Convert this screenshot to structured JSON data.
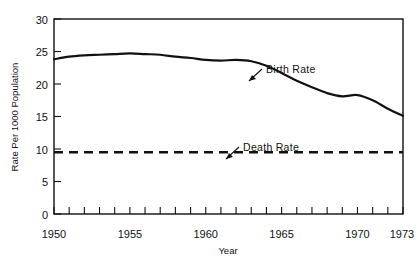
{
  "chart_data": {
    "type": "line",
    "title": "",
    "xlabel": "Year",
    "ylabel": "Rate Per 1000 Population",
    "xlim": [
      1950,
      1973
    ],
    "ylim": [
      0,
      30
    ],
    "grid": false,
    "legend_position": "inline-annotations",
    "x_tick_labels": [
      "1950",
      "1955",
      "1960",
      "1965",
      "1970",
      "1973"
    ],
    "x_tick_values": [
      1950,
      1955,
      1960,
      1965,
      1970,
      1973
    ],
    "x_minor_tick_interval": 1,
    "y_tick_labels": [
      "0",
      "5",
      "10",
      "15",
      "20",
      "25",
      "30"
    ],
    "y_tick_values": [
      0,
      5,
      10,
      15,
      20,
      25,
      30
    ],
    "x": [
      1950,
      1951,
      1952,
      1953,
      1954,
      1955,
      1956,
      1957,
      1958,
      1959,
      1960,
      1961,
      1962,
      1963,
      1964,
      1965,
      1966,
      1967,
      1968,
      1969,
      1970,
      1971,
      1972,
      1973
    ],
    "series": [
      {
        "name": "Birth Rate",
        "style": "solid",
        "color": "#111111",
        "values": [
          23.8,
          24.2,
          24.4,
          24.5,
          24.6,
          24.7,
          24.6,
          24.5,
          24.2,
          24.0,
          23.7,
          23.6,
          23.7,
          23.5,
          22.8,
          21.7,
          20.5,
          19.5,
          18.6,
          18.1,
          18.3,
          17.5,
          16.2,
          15.1
        ]
      },
      {
        "name": "Death Rate",
        "style": "dashed",
        "color": "#111111",
        "values": [
          9.5,
          9.5,
          9.5,
          9.5,
          9.5,
          9.5,
          9.5,
          9.5,
          9.5,
          9.5,
          9.5,
          9.5,
          9.5,
          9.5,
          9.5,
          9.5,
          9.5,
          9.5,
          9.5,
          9.5,
          9.5,
          9.5,
          9.5,
          9.5
        ]
      }
    ],
    "annotations": [
      {
        "text": "Birth Rate",
        "label_x": 266,
        "label_y": 73,
        "arrow_from_x": 262,
        "arrow_from_y": 70,
        "arrow_to_x": 248,
        "arrow_to_y": 82
      },
      {
        "text": "Death Rate",
        "label_x": 243,
        "label_y": 151,
        "arrow_from_x": 239,
        "arrow_from_y": 148,
        "arrow_to_x": 226,
        "arrow_to_y": 160
      }
    ]
  }
}
